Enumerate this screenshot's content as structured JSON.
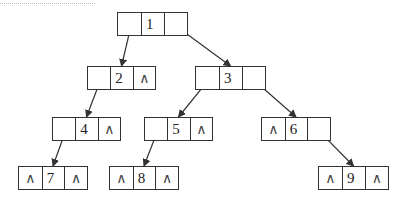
{
  "diagram": {
    "type": "binary-linked-tree",
    "null_symbol": "∧",
    "line_color": "#333333",
    "nodes": [
      {
        "id": "1",
        "label": "1",
        "left": "2",
        "right": "3",
        "x": 117,
        "y": 12,
        "w": 71
      },
      {
        "id": "2",
        "label": "2",
        "left": "4",
        "right": null,
        "x": 87,
        "y": 66,
        "w": 69
      },
      {
        "id": "3",
        "label": "3",
        "left": "5",
        "right": "6",
        "x": 195,
        "y": 66,
        "w": 71
      },
      {
        "id": "4",
        "label": "4",
        "left": "7",
        "right": null,
        "x": 52,
        "y": 117,
        "w": 69
      },
      {
        "id": "5",
        "label": "5",
        "left": "8",
        "right": null,
        "x": 144,
        "y": 117,
        "w": 69
      },
      {
        "id": "6",
        "label": "6",
        "left": null,
        "right": "9",
        "x": 261,
        "y": 117,
        "w": 70
      },
      {
        "id": "7",
        "label": "7",
        "left": null,
        "right": null,
        "x": 18,
        "y": 166,
        "w": 70
      },
      {
        "id": "8",
        "label": "8",
        "left": null,
        "right": null,
        "x": 109,
        "y": 166,
        "w": 70
      },
      {
        "id": "9",
        "label": "9",
        "left": null,
        "right": null,
        "x": 318,
        "y": 166,
        "w": 71
      }
    ],
    "edges": [
      {
        "from": "1",
        "to": "2",
        "side": "left"
      },
      {
        "from": "1",
        "to": "3",
        "side": "right"
      },
      {
        "from": "2",
        "to": "4",
        "side": "left"
      },
      {
        "from": "3",
        "to": "5",
        "side": "left"
      },
      {
        "from": "3",
        "to": "6",
        "side": "right"
      },
      {
        "from": "4",
        "to": "7",
        "side": "left"
      },
      {
        "from": "5",
        "to": "8",
        "side": "left"
      },
      {
        "from": "6",
        "to": "9",
        "side": "right"
      }
    ]
  }
}
